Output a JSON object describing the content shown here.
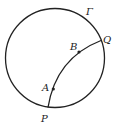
{
  "diagram": {
    "circle": {
      "label": "Γ",
      "cx": 55,
      "cy": 58,
      "r": 49.5
    },
    "arc": {
      "from": "P",
      "to": "Q",
      "path": "M 48 107.5 Q 56 58 101 40.5"
    },
    "points": [
      {
        "id": "P",
        "label": "P",
        "x": 48,
        "y": 107.5,
        "label_x": 41,
        "label_y": 122,
        "dot": false
      },
      {
        "id": "A",
        "label": "A",
        "x": 53.3,
        "y": 89,
        "label_x": 42,
        "label_y": 91,
        "dot": true
      },
      {
        "id": "B",
        "label": "B",
        "x": 79,
        "y": 52,
        "label_x": 70,
        "label_y": 50,
        "dot": true
      },
      {
        "id": "Q",
        "label": "Q",
        "x": 101,
        "y": 40.5,
        "label_x": 103,
        "label_y": 43,
        "dot": false
      }
    ],
    "gamma_label": {
      "text": "Γ",
      "x": 86,
      "y": 15
    },
    "stroke_color": "#222222"
  }
}
